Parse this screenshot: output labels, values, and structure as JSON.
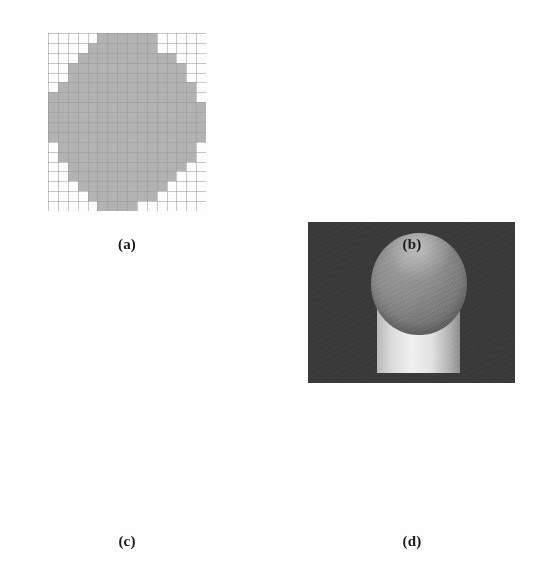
{
  "figure": {
    "background_color": "#fefefe",
    "panels": [
      {
        "id": "a",
        "caption": "(a)",
        "type": "binary-grid-map",
        "grid_cols": 16,
        "grid_rows": 18,
        "fill_color": "#b4b4b4",
        "empty_color": "#ffffff",
        "grid_line_color": "#9a9a9a",
        "rect": {
          "x": 48,
          "y": 33,
          "w": 158,
          "h": 178
        },
        "mask": [
          "0000011111100000",
          "0000111111100000",
          "0001111111111000",
          "0011111111111100",
          "0011111111111100",
          "0111111111111110",
          "1111111111111110",
          "1111111111111111",
          "1111111111111111",
          "1111111111111111",
          "1111111111111111",
          "0111111111111110",
          "0111111111111110",
          "0011111111111100",
          "0011111111111000",
          "0001111111110000",
          "0000111111100000",
          "0000011110000000"
        ]
      },
      {
        "id": "b",
        "caption": "(b)",
        "type": "photograph",
        "description": "dark background with light cylindrical rod capped by a spherical bead",
        "background_color": "#3a3a3a",
        "bead_color": "#8c8c8c",
        "rod_color": "#e2e2e2",
        "rect": {
          "x": 308,
          "y": 44,
          "w": 207,
          "h": 161
        }
      },
      {
        "id": "c",
        "caption": "(c)",
        "type": "binary-grid-map",
        "grid_cols": 16,
        "grid_rows": 17,
        "fill_color": "#b4b4b4",
        "empty_color": "#ffffff",
        "grid_line_color": "#9a9a9a",
        "rect": {
          "x": 48,
          "y": 340,
          "w": 160,
          "h": 168
        },
        "mask": [
          "0000011110000000",
          "0000111111000000",
          "0001111111100000",
          "0011111111100000",
          "0011111111100000",
          "0111111111100000",
          "0111111111110000",
          "0111111111111000",
          "1111111111111000",
          "1111111111111000",
          "1111111111110000",
          "0111111111110000",
          "0011111111110000",
          "0011111111110000",
          "0001111111110000",
          "0001111111110000",
          "0000000011100000"
        ]
      },
      {
        "id": "d",
        "caption": "(d)",
        "type": "photograph",
        "description": "gray field with a spherical droplet pinched between two dark wedge jaws",
        "background_color": "#8b8b8b",
        "jaw_color": "#545454",
        "droplet_color": "#9a9a9a",
        "scale_label": "1 mm",
        "rect": {
          "x": 312,
          "y": 346,
          "w": 201,
          "h": 154
        }
      }
    ],
    "captions": {
      "a": "(a)",
      "b": "(b)",
      "c": "(c)",
      "d": "(d)"
    }
  }
}
